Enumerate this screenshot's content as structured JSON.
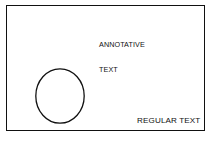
{
  "drawing": {
    "title": "Annotative vs Regular Text Example",
    "background_color": "#ffffff",
    "stroke_color": "#111111",
    "frame": {
      "name": "drawing-border",
      "x": 6,
      "y": 5,
      "width": 199,
      "height": 126,
      "line_weight": 1
    },
    "entities": {
      "circle": {
        "label": "circle",
        "center_x": 53,
        "center_y": 90,
        "radius_x": 24.5,
        "radius_y": 27.5,
        "fill": "none",
        "stroke": "#111111",
        "line_weight": 1.3
      },
      "annotative_text": {
        "line1": "ANNOTATIVE",
        "line2": "TEXT",
        "x": 92,
        "y": 18,
        "font_size": 7.2,
        "align": "left",
        "color": "#111111"
      },
      "regular_text": {
        "text": "REGULAR TEXT",
        "x": 116,
        "y": 100,
        "font_size": 8.1,
        "align": "left",
        "color": "#111111"
      }
    }
  }
}
